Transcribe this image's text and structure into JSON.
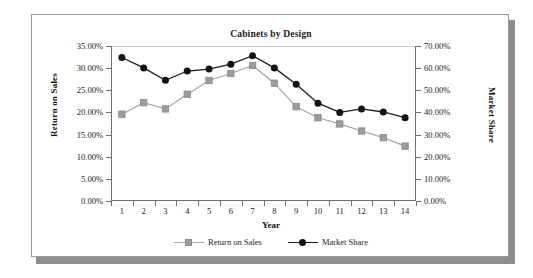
{
  "chart_data": {
    "type": "line",
    "title": "Cabinets by Design",
    "xlabel": "Year",
    "ylabel": "Return on Sales",
    "ylabel_secondary": "Market Share",
    "categories": [
      "1",
      "2",
      "3",
      "4",
      "5",
      "6",
      "7",
      "8",
      "9",
      "10",
      "11",
      "12",
      "13",
      "14"
    ],
    "ylim": [
      0,
      35
    ],
    "ylim_secondary": [
      0,
      70
    ],
    "ytick_labels": [
      "0.00%",
      "5.00%",
      "10.00%",
      "15.00%",
      "20.00%",
      "25.00%",
      "30.00%",
      "35.00%"
    ],
    "ytick_values": [
      0,
      5,
      10,
      15,
      20,
      25,
      30,
      35
    ],
    "ytick_labels_secondary": [
      "0.00%",
      "10.00%",
      "20.00%",
      "30.00%",
      "40.00%",
      "50.00%",
      "60.00%",
      "70.00%"
    ],
    "ytick_values_secondary": [
      0,
      10,
      20,
      30,
      40,
      50,
      60,
      70
    ],
    "grid": false,
    "legend_position": "bottom",
    "series": [
      {
        "name": "Return on Sales",
        "axis": "left",
        "color": "#a6a6a6",
        "marker": "square",
        "marker_color": "#9c9c9c",
        "values": [
          19.6,
          22.2,
          20.8,
          24.1,
          27.2,
          28.8,
          30.6,
          26.6,
          21.3,
          18.8,
          17.4,
          15.8,
          14.3,
          12.4
        ]
      },
      {
        "name": "Market Share",
        "axis": "right",
        "color": "#1c1c1c",
        "marker": "circle",
        "marker_color": "#141414",
        "values": [
          64.8,
          60.1,
          54.5,
          58.7,
          59.6,
          61.8,
          65.6,
          60.1,
          52.7,
          44.2,
          40.0,
          41.6,
          40.2,
          37.6
        ]
      }
    ]
  }
}
